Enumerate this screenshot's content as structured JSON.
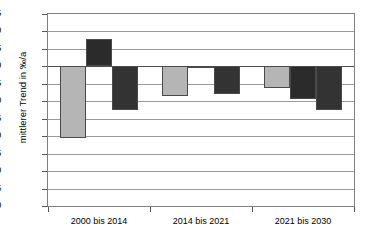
{
  "chart_data": {
    "type": "bar",
    "title": "",
    "xlabel": "",
    "ylabel": "mittlerer Trend in ‰/a",
    "categories": [
      "2000 bis 2014",
      "2014 bis 2021",
      "2021 bis 2030"
    ],
    "ylim": [
      -4.0,
      1.5
    ],
    "ytick_labels": [
      "1.5",
      "1.0",
      "0.5",
      "0.0",
      "-0.5",
      "-1.0",
      "-1.5",
      "-2.0",
      "-2.5",
      "-3.0",
      "-3.5",
      "-4.0"
    ],
    "ytick_values": [
      1.5,
      1.0,
      0.5,
      0.0,
      -0.5,
      -1.0,
      -1.5,
      -2.0,
      -2.5,
      -3.0,
      -3.5,
      -4.0
    ],
    "grid": true,
    "legend": "none",
    "series": [
      {
        "name": "series-1",
        "color": "#b5b5b5",
        "values": [
          -2.05,
          -0.85,
          -0.62
        ]
      },
      {
        "name": "series-2",
        "color": "#2b2b2b",
        "values": [
          0.78,
          -0.05,
          -0.95
        ]
      },
      {
        "name": "series-3",
        "color": "#333333",
        "values": [
          -1.25,
          -0.8,
          -1.25
        ]
      }
    ]
  },
  "colors": {
    "series_light_gray": "#b5b5b5",
    "series_dark_1": "#2b2b2b",
    "series_dark_2": "#333333",
    "gridline": "#9a9a9a",
    "zero_line": "#4d4d4d",
    "frame": "#808080",
    "background": "#ffffff"
  }
}
